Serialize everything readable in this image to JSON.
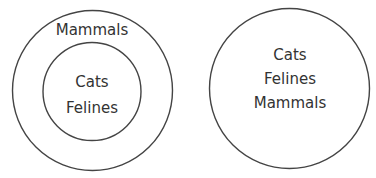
{
  "diagrams": [
    {
      "name": "nested",
      "outer_label": "Mammals",
      "inner_labels": [
        "Cats",
        "Felines"
      ]
    },
    {
      "name": "single",
      "labels": [
        "Cats",
        "Felines",
        "Mammals"
      ]
    }
  ],
  "colors": {
    "stroke": "#444444",
    "text": "#333333",
    "background": "#ffffff"
  }
}
